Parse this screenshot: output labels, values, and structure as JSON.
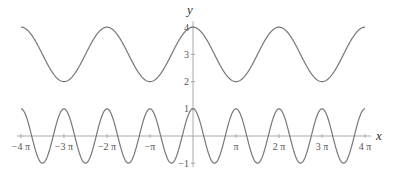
{
  "chart_data": {
    "type": "line",
    "title": "",
    "xlabel": "x",
    "ylabel": "y",
    "xlim": [
      -12.566,
      12.566
    ],
    "ylim": [
      -1,
      4
    ],
    "grid": false,
    "legend": null,
    "x_ticks": [
      {
        "value": -12.566,
        "label": "−4 π"
      },
      {
        "value": -9.425,
        "label": "−3 π"
      },
      {
        "value": -6.283,
        "label": "−2 π"
      },
      {
        "value": -3.1416,
        "label": "−π"
      },
      {
        "value": 3.1416,
        "label": "π"
      },
      {
        "value": 6.283,
        "label": "2 π"
      },
      {
        "value": 9.425,
        "label": "3 π"
      },
      {
        "value": 12.566,
        "label": "4 π"
      }
    ],
    "y_ticks": [
      {
        "value": -1,
        "label": "−1"
      },
      {
        "value": 1,
        "label": "1"
      },
      {
        "value": 2,
        "label": "2"
      },
      {
        "value": 3,
        "label": "3"
      },
      {
        "value": 4,
        "label": "4"
      }
    ],
    "series": [
      {
        "name": "y = 3 + cos(x)",
        "formula": "3+cos(x)",
        "color": "#777777",
        "max": 4,
        "min": 2,
        "period": "2π"
      },
      {
        "name": "y = cos(2x)",
        "formula": "cos(2x)",
        "color": "#777777",
        "max": 1,
        "min": -1,
        "period": "π"
      }
    ]
  },
  "layout": {
    "origin_px": [
      193,
      136
    ],
    "x_px_per_unit": 13.69,
    "y_px_per_unit": 27.2,
    "axis_color": "#aaaaaa",
    "curve_color": "#777777"
  }
}
